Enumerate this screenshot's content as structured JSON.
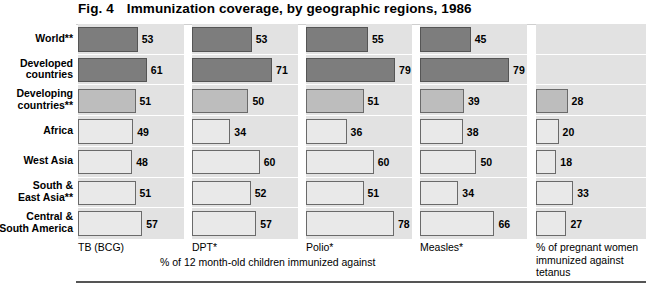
{
  "figure": {
    "number": "Fig. 4",
    "title": "Immunization coverage, by geographic regions, 1986"
  },
  "axis_note": "% of 12 month-old children immunized against",
  "tetanus_caption": "% of pregnant women immunized against tetanus",
  "rows": [
    {
      "label_line1": "World**",
      "label_line2": "",
      "shade": "dark"
    },
    {
      "label_line1": "Developed",
      "label_line2": "countries",
      "shade": "dark"
    },
    {
      "label_line1": "Developing",
      "label_line2": "countries**",
      "shade": "medium"
    },
    {
      "label_line1": "Africa",
      "label_line2": "",
      "shade": "light"
    },
    {
      "label_line1": "West Asia",
      "label_line2": "",
      "shade": "light"
    },
    {
      "label_line1": "South &",
      "label_line2": "East Asia**",
      "shade": "light"
    },
    {
      "label_line1": "Central &",
      "label_line2": "South America",
      "shade": "light"
    }
  ],
  "chart_data": {
    "type": "bar",
    "xlabel": "% of 12 month-old children immunized against",
    "ylabel": "",
    "xlim": [
      0,
      100
    ],
    "grid": false,
    "legend": "none",
    "orientation": "horizontal",
    "categories": [
      "World**",
      "Developed countries",
      "Developing countries**",
      "Africa",
      "West Asia",
      "South & East Asia**",
      "Central & South America"
    ],
    "series": [
      {
        "name": "TB (BCG)",
        "values": [
          53,
          61,
          51,
          49,
          48,
          51,
          57
        ]
      },
      {
        "name": "DPT*",
        "values": [
          53,
          71,
          50,
          34,
          60,
          52,
          57
        ]
      },
      {
        "name": "Polio*",
        "values": [
          55,
          79,
          51,
          36,
          60,
          51,
          78
        ]
      },
      {
        "name": "Measles*",
        "values": [
          45,
          79,
          39,
          38,
          50,
          34,
          66
        ]
      },
      {
        "name": "% of pregnant women immunized against tetanus",
        "values": [
          null,
          null,
          28,
          20,
          18,
          33,
          27
        ]
      }
    ]
  },
  "panels": [
    {
      "caption": "TB (BCG)",
      "caption_left": 78,
      "left": 78,
      "width": 106
    },
    {
      "caption": "DPT*",
      "caption_left": 192,
      "left": 192,
      "width": 106
    },
    {
      "caption": "Polio*",
      "caption_left": 306,
      "left": 306,
      "width": 106
    },
    {
      "caption": "Measles*",
      "caption_left": 420,
      "left": 420,
      "width": 107
    },
    {
      "caption": "",
      "caption_left": 536,
      "left": 536,
      "width": 110
    }
  ],
  "colors": {
    "band_background": "#e2e2e2",
    "bar_dark": "#7d7d7d",
    "bar_medium": "#bdbdbd",
    "bar_light": "#e9e9e9",
    "text": "#000000"
  }
}
